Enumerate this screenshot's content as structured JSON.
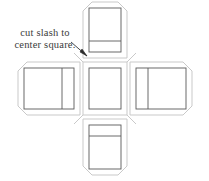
{
  "figure": {
    "background_color": "#ffffff",
    "outline_color": "#c9c9c9",
    "panel_color": "#595959",
    "leader_color": "#333333",
    "fill_color": "#ffffff"
  },
  "annotation": {
    "text": "cut slash to\ncenter square.",
    "line1": "cut slash to",
    "line2": "center square.",
    "font_color": "#3b3b3b",
    "leader": {
      "from_x": 71,
      "from_y": 42,
      "to_x": 88,
      "to_y": 57,
      "arrowhead": true
    }
  },
  "net": {
    "shape": "cross",
    "chamfer": 9,
    "panels": [
      {
        "name": "top-flap",
        "outer": {
          "x": 83,
          "y": 2,
          "w": 44,
          "h": 56
        },
        "inner": {
          "x": 89,
          "y": 8,
          "w": 32,
          "h": 44
        },
        "fold_line": {
          "orientation": "horizontal",
          "offset_from": "bottom",
          "offset": 11
        }
      },
      {
        "name": "left-flap",
        "outer": {
          "x": 18,
          "y": 62,
          "w": 62,
          "h": 53
        },
        "inner": {
          "x": 24,
          "y": 68,
          "w": 50,
          "h": 41
        },
        "fold_line": {
          "orientation": "vertical",
          "offset_from": "right",
          "offset": 12
        }
      },
      {
        "name": "center-square",
        "outer": {
          "x": 83,
          "y": 62,
          "w": 44,
          "h": 53
        },
        "inner": {
          "x": 89,
          "y": 68,
          "w": 32,
          "h": 41
        },
        "fold_line": null
      },
      {
        "name": "right-flap",
        "outer": {
          "x": 130,
          "y": 62,
          "w": 62,
          "h": 53
        },
        "inner": {
          "x": 136,
          "y": 68,
          "w": 50,
          "h": 41
        },
        "fold_line": {
          "orientation": "vertical",
          "offset_from": "left",
          "offset": 12
        }
      },
      {
        "name": "bottom-flap",
        "outer": {
          "x": 83,
          "y": 119,
          "w": 44,
          "h": 56
        },
        "inner": {
          "x": 89,
          "y": 125,
          "w": 32,
          "h": 44
        },
        "fold_line": {
          "orientation": "horizontal",
          "offset_from": "top",
          "offset": 11
        }
      }
    ]
  }
}
